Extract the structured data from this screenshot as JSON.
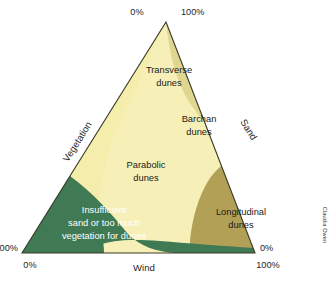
{
  "figure": {
    "kind": "ternary-diagram",
    "title_visible": false,
    "credit": "Claudia Owen"
  },
  "axes": [
    {
      "id": "vegetation",
      "name": "Vegetation",
      "side": "left"
    },
    {
      "id": "sand",
      "name": "Sand",
      "side": "right"
    },
    {
      "id": "wind",
      "name": "Wind",
      "side": "bottom"
    }
  ],
  "corner_labels": {
    "apex_left": "0%",
    "apex_right": "100%",
    "bottom_left_upper": "100%",
    "bottom_left_lower": "0%",
    "bottom_right_upper": "0%",
    "bottom_right_lower": "100%"
  },
  "regions": [
    {
      "id": "transverse",
      "label_line1": "Transverse",
      "label_line2": "dunes",
      "color": "#f4edab"
    },
    {
      "id": "barchan",
      "label_line1": "Barchan",
      "label_line2": "dunes",
      "color": "#e0d690"
    },
    {
      "id": "parabolic",
      "label_line1": "Parabolic",
      "label_line2": "dunes",
      "color": "#f6f0b8"
    },
    {
      "id": "longitudinal",
      "label_line1": "Longitudinal",
      "label_line2": "dunes",
      "color": "#b3a057"
    },
    {
      "id": "insufficient",
      "label_line1": "Insufficient",
      "label_line2": "sand or too much",
      "label_line3": "vegetation for dunes",
      "color": "#3f7a55"
    }
  ],
  "colors": {
    "pale_yellow": "#f6f0b8",
    "yellow": "#f4edab",
    "khaki": "#e0d690",
    "olive": "#b3a057",
    "green": "#3f7a55",
    "outline": "#3a3a28",
    "text": "#262626",
    "text_light": "#ffffff",
    "background": "#ffffff"
  }
}
